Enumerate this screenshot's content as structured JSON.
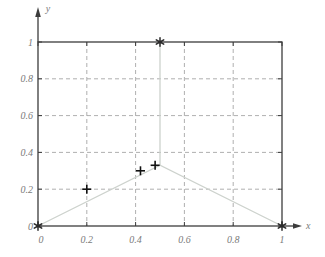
{
  "figure": {
    "background": "#ffffff"
  },
  "chart_data": {
    "type": "line",
    "title": "",
    "xlabel": "x",
    "ylabel": "y",
    "xlim": [
      0,
      1
    ],
    "ylim": [
      0,
      1
    ],
    "x_ticks": [
      0,
      0.2,
      0.4,
      0.6,
      0.8,
      1
    ],
    "x_tick_labels": [
      "0",
      "0.2",
      "0.4",
      "0.6",
      "0.8",
      "1"
    ],
    "y_ticks": [
      0,
      0.2,
      0.4,
      0.6,
      0.8,
      1
    ],
    "y_tick_labels": [
      "0",
      "0.2",
      "0.4",
      "0.6",
      "0.8",
      "1"
    ],
    "grid": {
      "style": "dashed",
      "color": "#9a9a9a"
    },
    "frame": {
      "color": "#3c3c3c"
    },
    "label_color": "#7a7a7a",
    "series": [
      {
        "name": "tent-line",
        "type": "line",
        "color": "#cdd2cd",
        "points": [
          [
            0,
            0
          ],
          [
            0.5,
            0.33
          ],
          [
            1,
            0
          ]
        ]
      },
      {
        "name": "spike-line",
        "type": "line",
        "color": "#cdd2cd",
        "points": [
          [
            0.5,
            0.33
          ],
          [
            0.5,
            1
          ]
        ]
      },
      {
        "name": "star-markers",
        "type": "scatter",
        "marker": "star",
        "color": "#2b2b2b",
        "points": [
          [
            0,
            0
          ],
          [
            0.5,
            1
          ],
          [
            1,
            0
          ]
        ]
      },
      {
        "name": "plus-markers",
        "type": "scatter",
        "marker": "plus",
        "color": "#111111",
        "points": [
          [
            0.2,
            0.2
          ],
          [
            0.42,
            0.3
          ],
          [
            0.48,
            0.33
          ]
        ]
      }
    ]
  }
}
